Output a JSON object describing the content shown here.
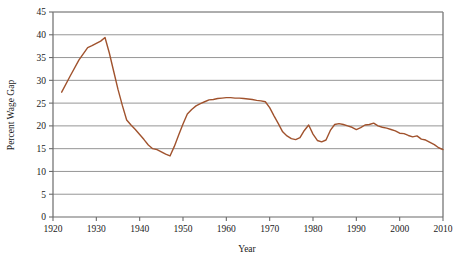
{
  "chart_data": {
    "type": "line",
    "title": "",
    "xlabel": "Year",
    "ylabel": "Percent Wage Gap",
    "xlim": [
      1920,
      2010
    ],
    "ylim": [
      0,
      45
    ],
    "grid": true,
    "legend": false,
    "line_color": "#A0522D",
    "axis_color": "#6b6b6b",
    "grid_color": "#8a8a8a",
    "xticks": [
      1920,
      1930,
      1940,
      1950,
      1960,
      1970,
      1980,
      1990,
      2000,
      2010
    ],
    "yticks": [
      0,
      5,
      10,
      15,
      20,
      25,
      30,
      35,
      40,
      45
    ],
    "xtick_labels": [
      "1920",
      "1930",
      "1940",
      "1950",
      "1960",
      "1970",
      "1980",
      "1990",
      "2000",
      "2010"
    ],
    "ytick_labels": [
      "0",
      "5",
      "10",
      "15",
      "20",
      "25",
      "30",
      "35",
      "40",
      "45"
    ],
    "x": [
      1922,
      1924,
      1926,
      1928,
      1929,
      1930,
      1931,
      1932,
      1933,
      1934,
      1935,
      1936,
      1937,
      1938,
      1939,
      1940,
      1941,
      1942,
      1943,
      1944,
      1945,
      1946,
      1947,
      1948,
      1949,
      1950,
      1951,
      1952,
      1953,
      1954,
      1955,
      1956,
      1957,
      1958,
      1959,
      1960,
      1961,
      1962,
      1963,
      1964,
      1965,
      1966,
      1967,
      1968,
      1969,
      1970,
      1971,
      1972,
      1973,
      1974,
      1975,
      1976,
      1977,
      1978,
      1979,
      1980,
      1981,
      1982,
      1983,
      1984,
      1985,
      1986,
      1987,
      1988,
      1989,
      1990,
      1991,
      1992,
      1993,
      1994,
      1995,
      1996,
      1997,
      1998,
      1999,
      2000,
      2001,
      2002,
      2003,
      2004,
      2005,
      2006,
      2007,
      2008,
      2009,
      2010
    ],
    "y": [
      27.4,
      31.0,
      34.5,
      37.2,
      37.6,
      38.1,
      38.6,
      39.4,
      36.0,
      32.0,
      28.0,
      24.5,
      21.3,
      20.2,
      19.2,
      18.1,
      17.0,
      15.8,
      15.0,
      14.8,
      14.3,
      13.8,
      13.4,
      15.5,
      18.0,
      20.4,
      22.6,
      23.6,
      24.4,
      24.9,
      25.3,
      25.7,
      25.8,
      26.0,
      26.1,
      26.2,
      26.2,
      26.1,
      26.1,
      26.0,
      25.9,
      25.8,
      25.6,
      25.5,
      25.3,
      24.0,
      22.2,
      20.5,
      18.7,
      17.8,
      17.2,
      17.0,
      17.4,
      19.0,
      20.2,
      18.2,
      16.8,
      16.5,
      16.9,
      19.0,
      20.3,
      20.5,
      20.3,
      20.0,
      19.7,
      19.2,
      19.6,
      20.2,
      20.3,
      20.6,
      20.0,
      19.7,
      19.5,
      19.2,
      18.9,
      18.4,
      18.3,
      17.9,
      17.6,
      17.8,
      17.1,
      16.9,
      16.4,
      15.9,
      15.2,
      14.8
    ]
  },
  "axis": {
    "x_title": "Year",
    "y_title": "Percent Wage Gap"
  }
}
